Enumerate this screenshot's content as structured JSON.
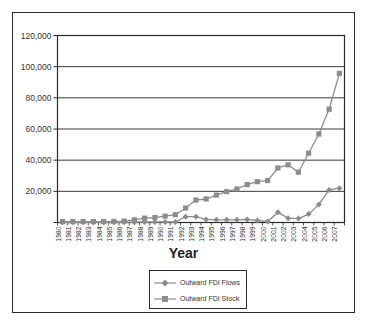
{
  "chart_data": {
    "type": "line",
    "title": "",
    "xlabel": "Year",
    "ylabel": "",
    "ylim": [
      0,
      120000
    ],
    "yticks": [
      "",
      "20,000",
      "40,000",
      "60,000",
      "80,000",
      "100,000",
      "120,000"
    ],
    "grid": true,
    "legend_position": "bottom",
    "categories": [
      "1980",
      "1981",
      "1982",
      "1983",
      "1984",
      "1985",
      "1986",
      "1987",
      "1988",
      "1989",
      "1990",
      "1991",
      "1992",
      "1993",
      "1994",
      "1995",
      "1996",
      "1997",
      "1998",
      "1999",
      "2000",
      "2001",
      "2002",
      "2003",
      "2004",
      "2005",
      "2006",
      "2007"
    ],
    "series": [
      {
        "name": "Outward FDI Flows",
        "marker": "diamond",
        "color": "#8c8c8c",
        "values": [
          100,
          100,
          100,
          100,
          100,
          100,
          100,
          200,
          300,
          300,
          400,
          300,
          3700,
          3700,
          2000,
          1700,
          1700,
          1700,
          2000,
          1300,
          600,
          6500,
          2800,
          2500,
          5400,
          11600,
          20900,
          22000
        ]
      },
      {
        "name": "Outward FDI Stock",
        "marker": "square",
        "color": "#8c8c8c",
        "values": [
          600,
          600,
          600,
          600,
          600,
          700,
          900,
          1700,
          2800,
          3200,
          4100,
          5000,
          9300,
          14400,
          15100,
          17600,
          19800,
          21500,
          24300,
          26200,
          26900,
          35000,
          37000,
          32300,
          44500,
          56800,
          72700,
          95700
        ]
      }
    ]
  },
  "legend": {
    "items": [
      "Outward FDI Flows",
      "Outward FDI Stock"
    ]
  },
  "axis": {
    "x_title": "Year"
  }
}
